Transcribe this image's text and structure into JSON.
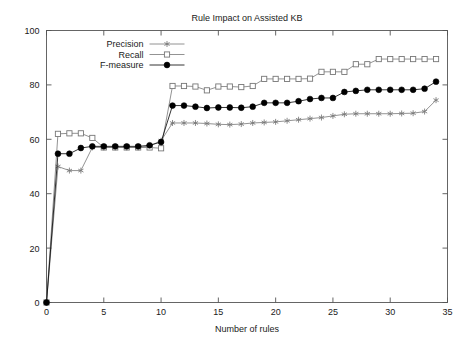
{
  "chart_data": {
    "type": "line",
    "title": "Rule Impact on Assisted KB",
    "xlabel": "Number of rules",
    "ylabel": "",
    "xlim": [
      0,
      35
    ],
    "ylim": [
      0,
      100
    ],
    "xticks": [
      0,
      5,
      10,
      15,
      20,
      25,
      30,
      35
    ],
    "yticks": [
      0,
      20,
      40,
      60,
      80,
      100
    ],
    "xticklabels": [
      "0",
      "5",
      "10",
      "15",
      "20",
      "25",
      "30",
      "35"
    ],
    "yticklabels": [
      "0",
      "20",
      "40",
      "60",
      "80",
      "100"
    ],
    "grid": false,
    "legend_position": "top-left inside",
    "x": [
      0,
      1,
      2,
      3,
      4,
      5,
      6,
      7,
      8,
      9,
      10,
      11,
      12,
      13,
      14,
      15,
      16,
      17,
      18,
      19,
      20,
      21,
      22,
      23,
      24,
      25,
      26,
      27,
      28,
      29,
      30,
      31,
      32,
      33,
      34
    ],
    "series": [
      {
        "name": "Precision",
        "marker": "star",
        "color": "#777777",
        "values": [
          0,
          50.0,
          48.5,
          48.5,
          57.0,
          57.0,
          57.0,
          57.0,
          57.0,
          57.5,
          59.5,
          66.0,
          66.0,
          66.0,
          65.8,
          65.5,
          65.4,
          65.6,
          66.0,
          66.2,
          66.4,
          66.8,
          67.2,
          67.6,
          68.0,
          68.6,
          69.2,
          69.4,
          69.4,
          69.4,
          69.4,
          69.5,
          69.6,
          70.2,
          74.4
        ]
      },
      {
        "name": "Recall",
        "marker": "open-square",
        "color": "#777777",
        "values": [
          0,
          62.0,
          62.2,
          62.2,
          60.5,
          57.0,
          57.0,
          57.0,
          57.0,
          57.0,
          56.7,
          79.6,
          79.6,
          79.4,
          78.0,
          79.4,
          79.4,
          79.2,
          79.6,
          82.2,
          82.2,
          82.2,
          82.2,
          82.3,
          84.8,
          84.8,
          84.8,
          87.6,
          87.6,
          89.5,
          89.5,
          89.5,
          89.5,
          89.5,
          89.5
        ]
      },
      {
        "name": "F-measure",
        "marker": "filled-circle",
        "color": "#000000",
        "values": [
          0,
          54.7,
          54.7,
          56.8,
          57.4,
          57.4,
          57.4,
          57.4,
          57.4,
          57.8,
          59.0,
          72.4,
          72.4,
          72.0,
          71.5,
          71.7,
          71.7,
          71.6,
          72.0,
          73.4,
          73.4,
          73.4,
          74.0,
          74.8,
          75.2,
          75.2,
          77.4,
          77.8,
          78.2,
          78.2,
          78.2,
          78.2,
          78.2,
          78.6,
          81.2
        ]
      }
    ]
  },
  "figure": {
    "title": "Rule Impact on Assisted KB",
    "xaxis_title": "Number of rules",
    "legend": [
      {
        "label": "Precision"
      },
      {
        "label": "Recall"
      },
      {
        "label": "F-measure"
      }
    ]
  }
}
